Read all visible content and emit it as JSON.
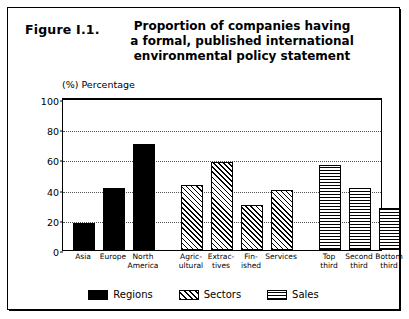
{
  "figure": {
    "number": "Figure I.1.",
    "title_lines": [
      "Proportion of companies having",
      "a formal, published international",
      "environmental policy statement"
    ]
  },
  "chart_data": {
    "type": "bar",
    "title": "Proportion of companies having a formal, published international environmental policy statement",
    "xlabel": "",
    "ylabel": "(%) Percentage",
    "ylim": [
      0,
      100
    ],
    "yticks": [
      0,
      20,
      40,
      60,
      80,
      100
    ],
    "grid": true,
    "legend_position": "bottom",
    "groups": [
      {
        "name": "Regions",
        "pattern": "solid-black",
        "categories": [
          "Asia",
          "Europe",
          "North America"
        ],
        "category_lines": [
          [
            "Asia"
          ],
          [
            "Europe"
          ],
          [
            "North",
            "America"
          ]
        ],
        "values": [
          18,
          41,
          70
        ]
      },
      {
        "name": "Sectors",
        "pattern": "diagonal-hatch",
        "categories": [
          "Agricultural",
          "Extractives",
          "Finished",
          "Services"
        ],
        "category_lines": [
          [
            "Agric-",
            "ultural"
          ],
          [
            "Extrac-",
            "tives"
          ],
          [
            "Fin-",
            "ished"
          ],
          [
            "Services"
          ]
        ],
        "values": [
          43,
          58,
          30,
          40
        ]
      },
      {
        "name": "Sales",
        "pattern": "grid-crosshatch",
        "categories": [
          "Top third",
          "Second third",
          "Bottom third"
        ],
        "category_lines": [
          [
            "Top",
            "third"
          ],
          [
            "Second",
            "third"
          ],
          [
            "Bottom",
            "third"
          ]
        ],
        "values": [
          56,
          41,
          28
        ]
      }
    ]
  },
  "legend": {
    "items": [
      {
        "label": "Regions",
        "pattern": "solid-black"
      },
      {
        "label": "Sectors",
        "pattern": "diagonal-hatch"
      },
      {
        "label": "Sales",
        "pattern": "grid-crosshatch"
      }
    ]
  },
  "colors": {
    "ink": "#000000",
    "paper": "#ffffff",
    "gridline": "#555555"
  }
}
